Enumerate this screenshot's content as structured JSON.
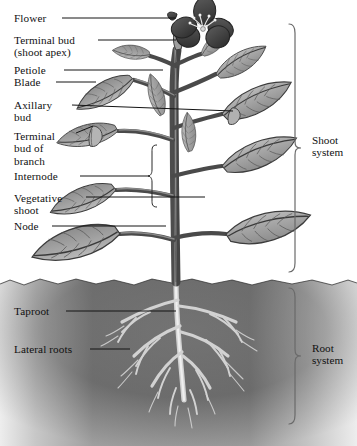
{
  "figure": {
    "style": "grayscale botanical line illustration",
    "background_color": "#ffffff",
    "ink_color": "#111111",
    "soil_color": "#6e6e6e",
    "leaf_fill": "#a9a9a9",
    "flower_color": "#4a4a4a",
    "root_color": "#cfcfcf"
  },
  "labels": [
    {
      "id": "flower",
      "text": "Flower",
      "text2": "",
      "x": 14,
      "y": 12,
      "leader": {
        "x1": 62,
        "y1": 18,
        "x2": 176,
        "y2": 18
      }
    },
    {
      "id": "terminal-bud",
      "text": "Terminal bud",
      "text2": "(shoot apex)",
      "x": 14,
      "y": 34,
      "leader": {
        "x1": 98,
        "y1": 40,
        "x2": 176,
        "y2": 40
      }
    },
    {
      "id": "petiole",
      "text": "Petiole",
      "text2": "",
      "x": 14,
      "y": 64,
      "leader": {
        "x1": 64,
        "y1": 70,
        "x2": 163,
        "y2": 70
      }
    },
    {
      "id": "blade",
      "text": "Blade",
      "text2": "",
      "x": 14,
      "y": 76,
      "leader": {
        "x1": 56,
        "y1": 82,
        "x2": 96,
        "y2": 82
      }
    },
    {
      "id": "axillary-bud",
      "text": "Axillary",
      "text2": "bud",
      "x": 14,
      "y": 99,
      "leader": {
        "x1": 72,
        "y1": 105,
        "x2": 233,
        "y2": 111
      }
    },
    {
      "id": "terminal-bud-branch",
      "text": "Terminal",
      "text2": "bud of\nbranch",
      "x": 14,
      "y": 130,
      "leader": {
        "x1": 76,
        "y1": 133,
        "x2": 93,
        "y2": 126
      }
    },
    {
      "id": "internode",
      "text": "Internode",
      "text2": "",
      "x": 14,
      "y": 170,
      "leader": {
        "x1": 80,
        "y1": 176,
        "x2": 150,
        "y2": 176
      }
    },
    {
      "id": "vegetative-shoot",
      "text": "Vegetative",
      "text2": "shoot",
      "x": 14,
      "y": 192,
      "leader": {
        "x1": 86,
        "y1": 197,
        "x2": 205,
        "y2": 197
      }
    },
    {
      "id": "node",
      "text": "Node",
      "text2": "",
      "x": 14,
      "y": 220,
      "leader": {
        "x1": 52,
        "y1": 226,
        "x2": 166,
        "y2": 226
      }
    },
    {
      "id": "taproot",
      "text": "Taproot",
      "text2": "",
      "x": 14,
      "y": 305,
      "leader": {
        "x1": 66,
        "y1": 311,
        "x2": 176,
        "y2": 311
      }
    },
    {
      "id": "lateral-roots",
      "text": "Lateral roots",
      "text2": "",
      "x": 14,
      "y": 343,
      "leader": {
        "x1": 90,
        "y1": 349,
        "x2": 130,
        "y2": 349
      }
    }
  ],
  "systems": [
    {
      "id": "shoot-system",
      "line1": "Shoot",
      "line2": "system",
      "x": 312,
      "y": 134,
      "brace": {
        "x": 295,
        "top": 24,
        "bottom": 272,
        "mid": 148
      }
    },
    {
      "id": "root-system",
      "line1": "Root",
      "line2": "system",
      "x": 312,
      "y": 342,
      "brace": {
        "x": 295,
        "top": 288,
        "bottom": 424,
        "mid": 356
      }
    }
  ],
  "regions": {
    "air": {
      "label": "above-ground",
      "y_top": 0,
      "y_bottom": 280
    },
    "soil": {
      "label": "below-ground soil",
      "y_top": 280,
      "y_bottom": 446
    }
  }
}
